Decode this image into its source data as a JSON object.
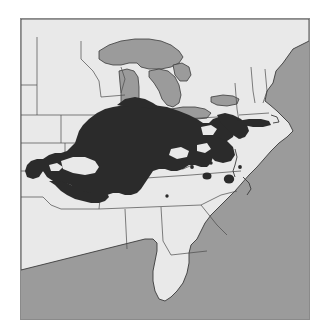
{
  "map": {
    "caption": "",
    "title": "",
    "type": "species distribution range map",
    "region": "Eastern and Central United States",
    "projection_note": "no graticule or scale bar shown",
    "frame": {
      "present": true,
      "border_color": "#8a8a8a",
      "left": 20,
      "top": 18,
      "width": 290,
      "height": 302
    },
    "colors": {
      "page_background": "#ffffff",
      "water": "#9b9b9b",
      "land": "#e9e9e9",
      "range_shading": "#2b2b2b",
      "boundary_line": "#4a4a4a",
      "coastline": "#3a3a3a"
    },
    "layers": [
      {
        "name": "ocean-background",
        "label": "Ocean and Gulf water",
        "fill": "#9b9b9b",
        "interactable": false
      },
      {
        "name": "land-mainland",
        "label": "Continental landmass",
        "fill": "#e9e9e9",
        "interactable": false
      },
      {
        "name": "great-lakes-group",
        "label": "Great Lakes",
        "fill": "#9b9b9b",
        "interactable": false
      },
      {
        "name": "state-boundaries-group",
        "label": "State boundary lines",
        "stroke": "#4a4a4a",
        "interactable": false
      },
      {
        "name": "species-range-group",
        "label": "Shaded distribution range",
        "fill": "#2b2b2b",
        "interactable": false
      },
      {
        "name": "species-range-gaps-group",
        "label": "Unoccupied interior gaps",
        "fill": "#e9e9e9",
        "interactable": false
      },
      {
        "name": "disjunct-population-dots-group",
        "label": "Disjunct population localities",
        "fill": "#2b2b2b",
        "interactable": false
      }
    ],
    "water_bodies": [
      {
        "name": "lake-superior",
        "label": "Lake Superior"
      },
      {
        "name": "lake-michigan",
        "label": "Lake Michigan"
      },
      {
        "name": "lake-huron",
        "label": "Lake Huron"
      },
      {
        "name": "lake-huron-georgian-bay",
        "label": "Georgian Bay"
      },
      {
        "name": "lake-erie",
        "label": "Lake Erie"
      },
      {
        "name": "lake-ontario",
        "label": "Lake Ontario"
      },
      {
        "name": "atlantic-ocean",
        "label": "Atlantic Ocean"
      },
      {
        "name": "gulf-of-mexico",
        "label": "Gulf of Mexico"
      }
    ],
    "range_description": {
      "core": "Continuous dark shading centered on the Ohio and middle Mississippi valleys",
      "core_states": [
        "Illinois",
        "Indiana",
        "Ohio",
        "Kentucky",
        "Tennessee",
        "Missouri",
        "West Virginia"
      ],
      "peripheral_states": [
        "Iowa",
        "Kansas",
        "Oklahoma",
        "Arkansas",
        "Pennsylvania",
        "Maryland",
        "Virginia",
        "New Jersey",
        "New York",
        "Wisconsin",
        "Michigan"
      ],
      "northern_limit": "southern Wisconsin and southern Michigan",
      "southern_limit": "northern Alabama, Mississippi and Georgia",
      "western_limit": "eastern Kansas and eastern Oklahoma",
      "eastern_limit": "Atlantic coastal plain of New Jersey and Long Island",
      "gaps": 5,
      "disjunct_localities": 6
    },
    "excluded_areas": [
      "Florida peninsula",
      "Gulf coastal plain",
      "southern Atlantic coastal plain",
      "northern Great Plains",
      "northern New England"
    ],
    "labels_visible": [],
    "legend_present": false,
    "scale_bar_present": false,
    "north_arrow_present": false
  }
}
